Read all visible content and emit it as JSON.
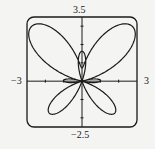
{
  "chart_data": {
    "type": "line",
    "title": "",
    "xlabel": "",
    "ylabel": "",
    "equation": "r = e^(sin θ) − 2 cos(4θ)",
    "coordinate_system": "polar",
    "theta_range": [
      0,
      6.2832
    ],
    "xlim": [
      -3,
      3
    ],
    "ylim": [
      -2.5,
      3.5
    ],
    "grid": false,
    "legend": null,
    "tick_labels": {
      "x_min": "−3",
      "x_max": "3",
      "y_min": "−2.5",
      "y_max": "3.5"
    },
    "series": [
      {
        "name": "butterfly curve",
        "color": "#1a1a1a",
        "points": [
          {
            "theta": 0,
            "x": -1.0,
            "y": 0.0
          },
          {
            "theta": 0.3927,
            "x": 1.354,
            "y": 0.561
          },
          {
            "theta": 0.7854,
            "x": 2.848,
            "y": 2.848
          },
          {
            "theta": 1.1781,
            "x": 0.964,
            "y": 2.327
          },
          {
            "theta": 1.5708,
            "x": 0.0,
            "y": 0.718
          },
          {
            "theta": 1.9635,
            "x": -0.964,
            "y": 2.327
          },
          {
            "theta": 2.3562,
            "x": -2.848,
            "y": 2.848
          },
          {
            "theta": 2.7489,
            "x": -1.354,
            "y": 0.561
          },
          {
            "theta": 3.1416,
            "x": 1.0,
            "y": 0.0
          },
          {
            "theta": 3.5343,
            "x": -0.63,
            "y": -0.261
          },
          {
            "theta": 3.927,
            "x": -1.763,
            "y": -1.763
          },
          {
            "theta": 4.3197,
            "x": -0.152,
            "y": -0.367
          },
          {
            "theta": 4.7124,
            "x": 0.0,
            "y": 1.632
          },
          {
            "theta": 5.1051,
            "x": 0.152,
            "y": -0.367
          },
          {
            "theta": 5.4978,
            "x": 1.763,
            "y": -1.763
          },
          {
            "theta": 5.8905,
            "x": 0.63,
            "y": -0.261
          }
        ]
      }
    ]
  },
  "plot": {
    "frame": {
      "left": 27,
      "top": 17,
      "right": 137,
      "bottom": 127,
      "radius": 7
    },
    "line_color": "#1a1a1a",
    "background": "#f4f4f2",
    "tick_values": {
      "x": [
        -2,
        -1,
        1,
        2
      ],
      "y": [
        -2,
        -1,
        1,
        2,
        3
      ]
    }
  }
}
